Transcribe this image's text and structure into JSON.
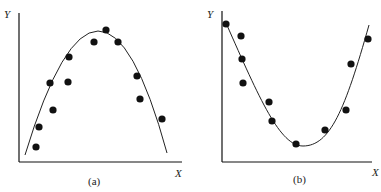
{
  "chart_data": [
    {
      "type": "scatter",
      "panel_label": "(a)",
      "xlabel": "X",
      "ylabel": "Y",
      "fit": "inverted parabola (concave down)",
      "points_px": [
        [
          36,
          147
        ],
        [
          39,
          127
        ],
        [
          50,
          83
        ],
        [
          53,
          110
        ],
        [
          69,
          57
        ],
        [
          68,
          82
        ],
        [
          94,
          42
        ],
        [
          106,
          30
        ],
        [
          118,
          42
        ],
        [
          137,
          76
        ],
        [
          140,
          99
        ],
        [
          162,
          119
        ]
      ],
      "curve_px": {
        "start": [
          25,
          155
        ],
        "peak": [
          100,
          31
        ],
        "end": [
          167,
          153
        ]
      }
    },
    {
      "type": "scatter",
      "panel_label": "(b)",
      "xlabel": "X",
      "ylabel": "Y",
      "fit": "parabola (concave up)",
      "points_px": [
        [
          226,
          24
        ],
        [
          241,
          36
        ],
        [
          242,
          59
        ],
        [
          243,
          83
        ],
        [
          269,
          102
        ],
        [
          272,
          121
        ],
        [
          296,
          144
        ],
        [
          325,
          130
        ],
        [
          346,
          110
        ],
        [
          351,
          64
        ],
        [
          368,
          39
        ]
      ],
      "curve_px": {
        "start": [
          226,
          23
        ],
        "min": [
          303,
          146
        ],
        "end": [
          369,
          25
        ]
      }
    }
  ],
  "labels": {
    "a_caption": "(a)",
    "a_x": "X",
    "a_y": "Y",
    "b_caption": "(b)",
    "b_x": "X",
    "b_y": "Y"
  },
  "colors": {
    "ink": "#111111",
    "background": "#ffffff"
  }
}
